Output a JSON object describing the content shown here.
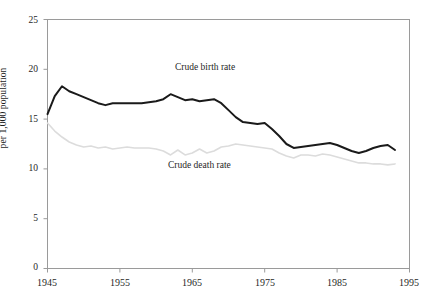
{
  "figure": {
    "title_remnant": "",
    "background": "#ffffff"
  },
  "chart_data": {
    "type": "line",
    "title": "",
    "subtitle": "",
    "xlabel": "",
    "ylabel": "per 1,000 population",
    "xlim": [
      1945,
      1995
    ],
    "ylim": [
      0,
      25
    ],
    "grid": false,
    "legend_position": "inline-annotations",
    "xticks": [
      1945,
      1955,
      1965,
      1975,
      1985,
      1995
    ],
    "xtick_labels": [
      "1945",
      "1955",
      "1965",
      "1975",
      "1985",
      "1995"
    ],
    "yticks": [
      0,
      5,
      10,
      15,
      20,
      25
    ],
    "ytick_labels": [
      "0",
      "5",
      "10",
      "15",
      "20",
      "25"
    ],
    "annotations": [
      {
        "text": "Crude birth rate",
        "x": 1961,
        "y": 20.2
      },
      {
        "text": "Crude death rate",
        "x": 1960,
        "y": 10.4
      }
    ],
    "x": [
      1945,
      1946,
      1947,
      1948,
      1949,
      1950,
      1951,
      1952,
      1953,
      1954,
      1955,
      1956,
      1957,
      1958,
      1959,
      1960,
      1961,
      1962,
      1963,
      1964,
      1965,
      1966,
      1967,
      1968,
      1969,
      1970,
      1971,
      1972,
      1973,
      1974,
      1975,
      1976,
      1977,
      1978,
      1979,
      1980,
      1981,
      1982,
      1983,
      1984,
      1985,
      1986,
      1987,
      1988,
      1989,
      1990,
      1991,
      1992,
      1993
    ],
    "series": [
      {
        "name": "Crude birth rate",
        "color": "#1a1a1a",
        "line_width": 2.0,
        "values": [
          15.5,
          17.3,
          18.3,
          17.8,
          17.5,
          17.2,
          16.9,
          16.6,
          16.4,
          16.6,
          16.6,
          16.6,
          16.6,
          16.6,
          16.7,
          16.8,
          17.0,
          17.5,
          17.2,
          16.9,
          17.0,
          16.8,
          16.9,
          17.0,
          16.6,
          15.9,
          15.2,
          14.7,
          14.6,
          14.5,
          14.6,
          14.0,
          13.3,
          12.5,
          12.1,
          12.2,
          12.3,
          12.4,
          12.5,
          12.6,
          12.4,
          12.1,
          11.8,
          11.6,
          11.8,
          12.1,
          12.3,
          12.4,
          11.9
        ]
      },
      {
        "name": "Crude death rate",
        "color": "#dcdcdc",
        "line_width": 1.6,
        "values": [
          14.6,
          13.8,
          13.2,
          12.7,
          12.4,
          12.2,
          12.3,
          12.1,
          12.2,
          12.0,
          12.1,
          12.2,
          12.1,
          12.1,
          12.1,
          12.0,
          11.8,
          11.4,
          11.9,
          11.4,
          11.6,
          12.0,
          11.6,
          11.8,
          12.2,
          12.3,
          12.5,
          12.4,
          12.3,
          12.2,
          12.1,
          12.0,
          11.6,
          11.3,
          11.1,
          11.4,
          11.4,
          11.3,
          11.5,
          11.4,
          11.2,
          11.0,
          10.8,
          10.6,
          10.6,
          10.5,
          10.5,
          10.4,
          10.5
        ]
      }
    ]
  },
  "axes": {
    "frame_color": "#9a9a9a",
    "tick_color": "#9a9a9a"
  }
}
